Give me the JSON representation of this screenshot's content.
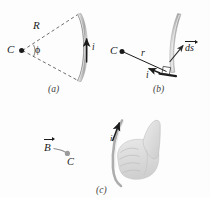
{
  "figure": {
    "panels": [
      {
        "tag": "(a)",
        "description": "Circular arc of radius R subtending angle phi at center C, carrying current i",
        "labels": {
          "center": "C",
          "radius": "R",
          "angle": "ϕ",
          "current": "i"
        }
      },
      {
        "tag": "(b)",
        "description": "Differential element ds of the arc at distance r from center C",
        "labels": {
          "center": "C",
          "distance": "r",
          "element": "ds",
          "current": "i"
        }
      },
      {
        "tag": "(c)",
        "description": "Right-hand rule: fingers curl along current, thumb gives field direction B at C",
        "labels": {
          "field": "B",
          "center": "C",
          "current": "i"
        }
      }
    ]
  },
  "colors": {
    "ink": "#1b1b1b",
    "wire_light": "#d7d7d7",
    "wire_mid": "#b4b4b4",
    "wire_dark": "#8d8d8d",
    "dashed": "#4a4a4a",
    "hand_fill": "#e3e3e3",
    "hand_shade": "#cfcfcf",
    "hand_line": "#bdbdbd",
    "gray_dot": "#9b9b9b",
    "tag": "#3d3d3d"
  }
}
